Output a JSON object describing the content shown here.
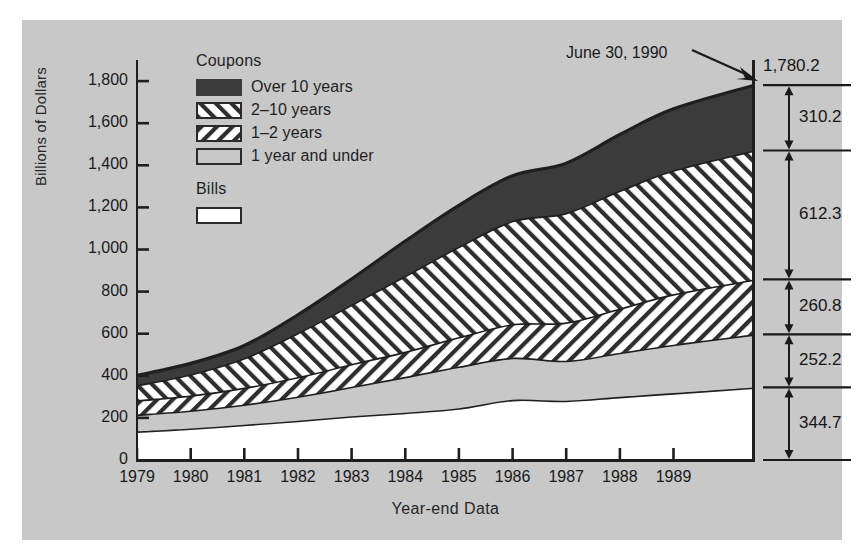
{
  "chart_data": {
    "type": "area",
    "title": "",
    "xlabel": "Year-end Data",
    "ylabel": "Billions of Dollars",
    "ylim": [
      0,
      1900
    ],
    "yticks": [
      "0",
      "200",
      "400",
      "600",
      "800",
      "1,000",
      "1,200",
      "1,400",
      "1,600",
      "1,800"
    ],
    "ytick_values": [
      0,
      200,
      400,
      600,
      800,
      1000,
      1200,
      1400,
      1600,
      1800
    ],
    "categories": [
      "1979",
      "1980",
      "1981",
      "1982",
      "1983",
      "1984",
      "1985",
      "1986",
      "1987",
      "1988",
      "1989",
      "June 30, 1990"
    ],
    "x_values": [
      1979,
      1980,
      1981,
      1982,
      1983,
      1984,
      1985,
      1986,
      1987,
      1988,
      1989,
      1990.5
    ],
    "grid": false,
    "legend_position": "inside-top-left",
    "stacking": "cumulative from bottom",
    "series": [
      {
        "name": "Bills",
        "pattern": "white",
        "values": [
          136,
          150,
          168,
          187,
          208,
          225,
          246,
          286,
          282,
          300,
          318,
          344.7
        ]
      },
      {
        "name": "1 year and under",
        "pattern": "light-gray",
        "values": [
          80,
          85,
          96,
          115,
          140,
          170,
          198,
          200,
          190,
          210,
          230,
          252.2
        ]
      },
      {
        "name": "1-2 years",
        "pattern": "forward-hatch",
        "values": [
          68,
          72,
          80,
          92,
          108,
          120,
          140,
          160,
          182,
          210,
          240,
          260.8
        ]
      },
      {
        "name": "2-10 years",
        "pattern": "backward-hatch",
        "values": [
          72,
          100,
          140,
          210,
          282,
          360,
          430,
          490,
          520,
          560,
          588,
          612.3
        ]
      },
      {
        "name": "Over 10 years",
        "pattern": "dark-solid",
        "values": [
          46,
          52,
          60,
          86,
          122,
          165,
          196,
          214,
          236,
          266,
          292,
          310.2
        ]
      }
    ],
    "cumulative_totals": [
      402,
      459,
      544,
      690,
      860,
      1040,
      1210,
      1350,
      1410,
      1546,
      1668,
      1780.2
    ]
  },
  "legend": {
    "coupons_heading": "Coupons",
    "bills_heading": "Bills",
    "items": [
      {
        "label": "Over 10 years"
      },
      {
        "label": "2–10 years"
      },
      {
        "label": "1–2 years"
      },
      {
        "label": "1 year and under"
      }
    ],
    "bills_item": {
      "label": ""
    }
  },
  "callout": {
    "text": "June 30, 1990"
  },
  "bracket": {
    "total": "1,780.2",
    "segments": [
      {
        "label": "310.2"
      },
      {
        "label": "612.3"
      },
      {
        "label": "260.8"
      },
      {
        "label": "252.2"
      },
      {
        "label": "344.7"
      }
    ]
  },
  "colors": {
    "panel_background": "#c8c8c8",
    "page_background": "#ffffff",
    "ink": "#1a1a1a",
    "dark_band": "#3b3b3b",
    "light_gray_band": "#c8c8c8",
    "white_band": "#ffffff"
  }
}
